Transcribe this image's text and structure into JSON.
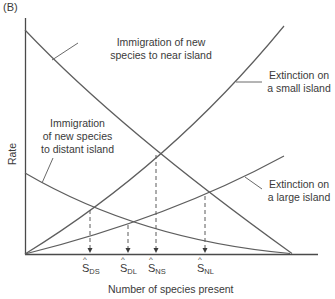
{
  "panel_label": "(B)",
  "axes": {
    "y_label": "Rate",
    "x_label": "Number of species present"
  },
  "curves": [
    {
      "id": "immigration-near",
      "label_line1": "Immigration of new",
      "label_line2": "species to near island"
    },
    {
      "id": "immigration-distant",
      "label_line1": "Immigration",
      "label_line2": "of new species",
      "label_line3": "to distant island"
    },
    {
      "id": "extinction-small",
      "label_line1": "Extinction on",
      "label_line2": "a small island"
    },
    {
      "id": "extinction-large",
      "label_line1": "Extinction on",
      "label_line2": "a large island"
    }
  ],
  "equilibria": [
    {
      "symbol": "S",
      "sub": "DS"
    },
    {
      "symbol": "S",
      "sub": "DL"
    },
    {
      "symbol": "S",
      "sub": "NS"
    },
    {
      "symbol": "S",
      "sub": "NL"
    }
  ],
  "colors": {
    "line": "#5a5a5a",
    "axis": "#4a4a4a",
    "text": "#3a3a3a"
  }
}
